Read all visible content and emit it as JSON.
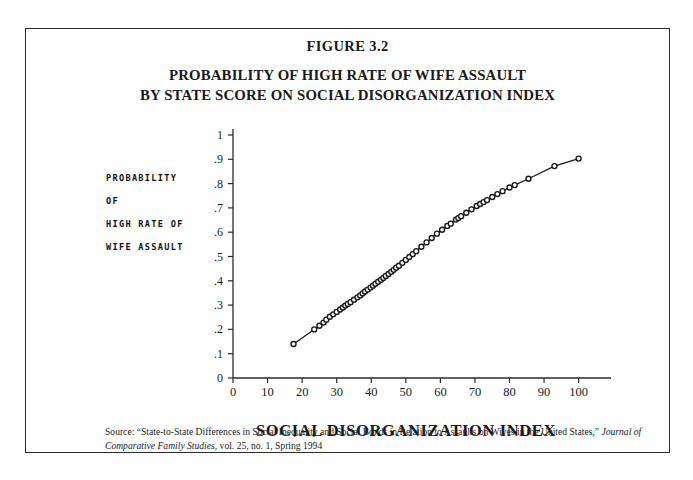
{
  "figure": {
    "number_label": "FIGURE 3.2",
    "title_line1": "PROBABILITY OF HIGH RATE OF WIFE ASSAULT",
    "title_line2": "BY STATE SCORE ON SOCIAL DISORGANIZATION INDEX",
    "frame_color": "#2b2b2b"
  },
  "ylabel": {
    "line1": "PROBABILITY",
    "line2": "OF",
    "line3": "HIGH RATE OF",
    "line4": "WIFE ASSAULT"
  },
  "source": {
    "prefix": "Source: “State-to-State Differences in Social Inequality and Social Bonds in Relation to Assaults on Wives in the United States,” ",
    "journal": "Journal of Comparative Family Studies",
    "suffix": ", vol. 25, no. 1, Spring 1994"
  },
  "chart_data": {
    "type": "scatter",
    "title": "PROBABILITY OF HIGH RATE OF WIFE ASSAULT BY STATE SCORE ON SOCIAL DISORGANIZATION INDEX",
    "subtitle": "FIGURE 3.2",
    "xlabel": "SOCIAL DISORGANIZATION INDEX",
    "ylabel": "PROBABILITY OF HIGH RATE OF WIFE ASSAULT",
    "xlim": [
      0,
      103
    ],
    "ylim": [
      0,
      1.02
    ],
    "grid": false,
    "legend": false,
    "marker": "open-circle",
    "line_connected": true,
    "xticks": [
      0,
      10,
      20,
      30,
      40,
      50,
      60,
      70,
      80,
      90,
      100
    ],
    "xtick_labels": [
      "0",
      "10",
      "20",
      "30",
      "40",
      "50",
      "60",
      "70",
      "80",
      "90",
      "100"
    ],
    "yticks": [
      0,
      0.1,
      0.2,
      0.3,
      0.4,
      0.5,
      0.6,
      0.7,
      0.8,
      0.9,
      1
    ],
    "ytick_labels": [
      "0",
      ".1",
      ".2",
      ".3",
      ".4",
      ".5",
      ".6",
      ".7",
      ".8",
      ".9",
      "1"
    ],
    "x": [
      17.5,
      23.5,
      25.0,
      26.2,
      27.0,
      28.0,
      29.0,
      30.0,
      31.0,
      31.8,
      32.5,
      33.2,
      34.0,
      35.0,
      36.0,
      36.8,
      37.5,
      38.2,
      39.0,
      39.8,
      40.5,
      41.2,
      42.0,
      42.8,
      43.5,
      44.2,
      45.0,
      45.8,
      46.5,
      47.2,
      48.0,
      49.0,
      50.0,
      51.0,
      52.0,
      53.0,
      54.5,
      56.0,
      57.5,
      59.0,
      60.5,
      62.0,
      63.0,
      64.5,
      65.2,
      66.0,
      67.5,
      69.0,
      70.5,
      71.5,
      72.5,
      73.5,
      75.0,
      76.5,
      78.0,
      80.0,
      81.5,
      85.5,
      93.0,
      100.0
    ],
    "y": [
      0.14,
      0.2,
      0.215,
      0.228,
      0.24,
      0.252,
      0.262,
      0.272,
      0.282,
      0.29,
      0.298,
      0.305,
      0.312,
      0.322,
      0.332,
      0.34,
      0.348,
      0.356,
      0.364,
      0.372,
      0.38,
      0.388,
      0.396,
      0.404,
      0.412,
      0.42,
      0.428,
      0.437,
      0.445,
      0.454,
      0.462,
      0.474,
      0.486,
      0.498,
      0.51,
      0.522,
      0.54,
      0.558,
      0.576,
      0.594,
      0.61,
      0.626,
      0.635,
      0.652,
      0.658,
      0.666,
      0.68,
      0.694,
      0.708,
      0.716,
      0.724,
      0.732,
      0.745,
      0.757,
      0.769,
      0.784,
      0.794,
      0.82,
      0.872,
      0.903
    ]
  }
}
